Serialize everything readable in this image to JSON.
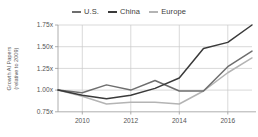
{
  "legend": {
    "position": "top-center",
    "items": [
      {
        "label": "U.S.",
        "color": "#6e6e6e",
        "icon": "line-swatch-icon"
      },
      {
        "label": "China",
        "color": "#3a3a3a",
        "icon": "line-swatch-icon"
      },
      {
        "label": "Europe",
        "color": "#b4b4b4",
        "icon": "line-swatch-icon"
      }
    ]
  },
  "axis": {
    "y_title_line1": "Growth AI Papers",
    "y_title_line2": "(relative to 2009)",
    "y_ticks": [
      "1.75x",
      "1.50x",
      "1.25x",
      "1.00x",
      "0.75x"
    ],
    "x_ticks": [
      "2010",
      "2012",
      "2014",
      "2016"
    ]
  },
  "chart_data": {
    "type": "line",
    "title": "",
    "xlabel": "",
    "ylabel": "Growth AI Papers (relative to 2009)",
    "grid": true,
    "legend_position": "top-center",
    "xlim": [
      2009,
      2017
    ],
    "ylim": [
      0.75,
      1.75
    ],
    "ytick_values": [
      1.75,
      1.5,
      1.25,
      1.0,
      0.75
    ],
    "ytick_labels": [
      "1.75x",
      "1.50x",
      "1.25x",
      "1.00x",
      "0.75x"
    ],
    "xtick_values": [
      2010,
      2012,
      2014,
      2016
    ],
    "xtick_labels": [
      "2010",
      "2012",
      "2014",
      "2016"
    ],
    "x": [
      2009,
      2010,
      2011,
      2012,
      2013,
      2014,
      2015,
      2016,
      2017
    ],
    "series": [
      {
        "name": "U.S.",
        "color": "#6e6e6e",
        "values": [
          1.0,
          0.97,
          1.06,
          1.0,
          1.11,
          0.99,
          0.99,
          1.27,
          1.45
        ]
      },
      {
        "name": "China",
        "color": "#3a3a3a",
        "values": [
          1.0,
          0.94,
          0.9,
          0.94,
          1.02,
          1.14,
          1.48,
          1.55,
          1.75
        ]
      },
      {
        "name": "Europe",
        "color": "#b4b4b4",
        "values": [
          1.0,
          0.93,
          0.84,
          0.86,
          0.86,
          0.84,
          0.99,
          1.2,
          1.37
        ]
      }
    ]
  },
  "colors": {
    "grid": "#c8c8c8",
    "axis": "#9a9a9a",
    "text": "#555555",
    "background": "#ffffff"
  }
}
